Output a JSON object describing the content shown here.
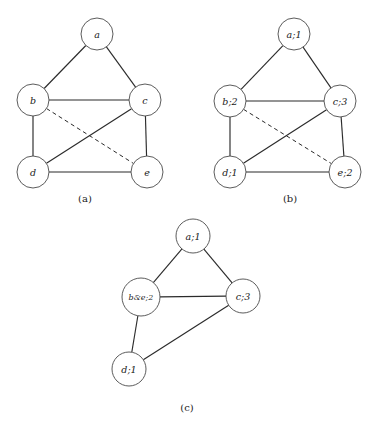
{
  "figure": {
    "background_color": "#ffffff",
    "stroke_color": "#2b2b2b",
    "node_fill": "#ffffff",
    "node_stroke": "#4a4a4a",
    "width": 374,
    "height": 421
  },
  "panels": [
    {
      "id": "panel-a",
      "caption": "(a)",
      "caption_pos": {
        "x": 85,
        "y": 198
      },
      "nodes": [
        {
          "id": "a",
          "label": "a",
          "x": 97,
          "y": 34,
          "r": 16,
          "compact": false
        },
        {
          "id": "b",
          "label": "b",
          "x": 33,
          "y": 100,
          "r": 16,
          "compact": false
        },
        {
          "id": "c",
          "label": "c",
          "x": 145,
          "y": 100,
          "r": 16,
          "compact": false
        },
        {
          "id": "d",
          "label": "d",
          "x": 33,
          "y": 172,
          "r": 16,
          "compact": false
        },
        {
          "id": "e",
          "label": "e",
          "x": 147,
          "y": 172,
          "r": 16,
          "compact": false
        }
      ],
      "edges": [
        {
          "from": "a",
          "to": "b",
          "style": "solid"
        },
        {
          "from": "a",
          "to": "c",
          "style": "solid"
        },
        {
          "from": "b",
          "to": "c",
          "style": "solid"
        },
        {
          "from": "b",
          "to": "d",
          "style": "solid"
        },
        {
          "from": "c",
          "to": "e",
          "style": "solid"
        },
        {
          "from": "d",
          "to": "e",
          "style": "solid"
        },
        {
          "from": "d",
          "to": "c",
          "style": "solid"
        },
        {
          "from": "b",
          "to": "e",
          "style": "dashed"
        }
      ]
    },
    {
      "id": "panel-b",
      "caption": "(b)",
      "caption_pos": {
        "x": 290,
        "y": 198
      },
      "nodes": [
        {
          "id": "a",
          "label": "a;1",
          "x": 294,
          "y": 34,
          "r": 16,
          "compact": false
        },
        {
          "id": "b",
          "label": "b;2",
          "x": 230,
          "y": 101,
          "r": 16,
          "compact": false
        },
        {
          "id": "c",
          "label": "c;3",
          "x": 340,
          "y": 101,
          "r": 16,
          "compact": false
        },
        {
          "id": "d",
          "label": "d;1",
          "x": 230,
          "y": 172,
          "r": 16,
          "compact": false
        },
        {
          "id": "e",
          "label": "e;2",
          "x": 345,
          "y": 172,
          "r": 16,
          "compact": false
        }
      ],
      "edges": [
        {
          "from": "a",
          "to": "b",
          "style": "solid"
        },
        {
          "from": "a",
          "to": "c",
          "style": "solid"
        },
        {
          "from": "b",
          "to": "c",
          "style": "solid"
        },
        {
          "from": "b",
          "to": "d",
          "style": "solid"
        },
        {
          "from": "c",
          "to": "e",
          "style": "solid"
        },
        {
          "from": "d",
          "to": "e",
          "style": "solid"
        },
        {
          "from": "d",
          "to": "c",
          "style": "solid"
        },
        {
          "from": "b",
          "to": "e",
          "style": "dashed"
        }
      ]
    },
    {
      "id": "panel-c",
      "caption": "(c)",
      "caption_pos": {
        "x": 187,
        "y": 407
      },
      "nodes": [
        {
          "id": "a",
          "label": "a;1",
          "x": 193,
          "y": 236,
          "r": 17,
          "compact": false
        },
        {
          "id": "be",
          "label": "b&e;2",
          "x": 141,
          "y": 297,
          "r": 19,
          "compact": true
        },
        {
          "id": "c",
          "label": "c;3",
          "x": 243,
          "y": 296,
          "r": 17,
          "compact": false
        },
        {
          "id": "d",
          "label": "d;1",
          "x": 129,
          "y": 369,
          "r": 17,
          "compact": false
        }
      ],
      "edges": [
        {
          "from": "a",
          "to": "be",
          "style": "solid"
        },
        {
          "from": "a",
          "to": "c",
          "style": "solid"
        },
        {
          "from": "be",
          "to": "c",
          "style": "solid"
        },
        {
          "from": "be",
          "to": "d",
          "style": "solid"
        },
        {
          "from": "d",
          "to": "c",
          "style": "solid"
        }
      ]
    }
  ]
}
